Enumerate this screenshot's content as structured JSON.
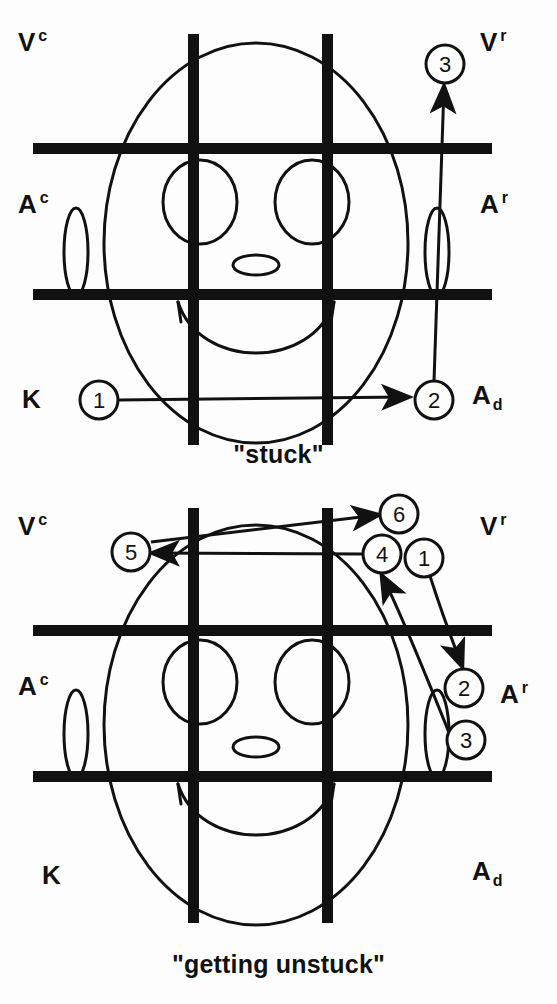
{
  "figure": {
    "type": "diagram",
    "background_color": "#fdfdfd",
    "ink_color": "#111111"
  },
  "panels": [
    {
      "id": "stuck",
      "caption": "\"stuck\"",
      "quadrant_labels": [
        {
          "id": "vc",
          "base": "V",
          "sup": "c",
          "x": 18,
          "y": 28
        },
        {
          "id": "vr",
          "base": "V",
          "sup": "r",
          "x": 478,
          "y": 28
        },
        {
          "id": "ac",
          "base": "A",
          "sup": "c",
          "x": 18,
          "y": 190
        },
        {
          "id": "ar",
          "base": "A",
          "sup": "r",
          "x": 478,
          "y": 190
        },
        {
          "id": "k",
          "base": "K",
          "sup": "",
          "x": 22,
          "y": 382
        },
        {
          "id": "ad",
          "base": "A",
          "sub": "d",
          "x": 470,
          "y": 382
        }
      ],
      "markers": [
        {
          "label": "1",
          "cx": 99,
          "cy": 400,
          "r": 19
        },
        {
          "label": "2",
          "cx": 434,
          "cy": 400,
          "r": 19
        },
        {
          "label": "3",
          "cx": 445,
          "cy": 64,
          "r": 19
        }
      ],
      "arrows": [
        {
          "from": "1",
          "to": "2",
          "kind": "horizontal-right"
        },
        {
          "from": "2",
          "to": "3",
          "kind": "vertical-up"
        }
      ]
    },
    {
      "id": "unstuck",
      "caption": "\"getting unstuck\"",
      "quadrant_labels": [
        {
          "id": "vc",
          "base": "V",
          "sup": "c",
          "x": 18,
          "y": 512
        },
        {
          "id": "vr",
          "base": "V",
          "sup": "r",
          "x": 478,
          "y": 512
        },
        {
          "id": "ac",
          "base": "A",
          "sup": "c",
          "x": 18,
          "y": 672
        },
        {
          "id": "ar",
          "base": "A",
          "sup": "r",
          "x": 478,
          "y": 680
        },
        {
          "id": "k",
          "base": "K",
          "sup": "",
          "x": 42,
          "y": 862
        },
        {
          "id": "ad",
          "base": "A",
          "sub": "d",
          "x": 470,
          "y": 862
        }
      ],
      "markers": [
        {
          "label": "1",
          "cx": 424,
          "cy": 558,
          "r": 19
        },
        {
          "label": "2",
          "cx": 464,
          "cy": 688,
          "r": 19
        },
        {
          "label": "3",
          "cx": 466,
          "cy": 740,
          "r": 19
        },
        {
          "label": "4",
          "cx": 382,
          "cy": 554,
          "r": 19
        },
        {
          "label": "5",
          "cx": 131,
          "cy": 552,
          "r": 19
        },
        {
          "label": "6",
          "cx": 399,
          "cy": 514,
          "r": 19
        }
      ],
      "arrows": [
        {
          "from": "1",
          "to": "2",
          "kind": "curve-down-right"
        },
        {
          "from": "3",
          "to": "4",
          "kind": "curve-up-left"
        },
        {
          "from": "4",
          "to": "5",
          "kind": "horizontal-left"
        },
        {
          "from": "5",
          "to": "6",
          "kind": "diagonal-up-right"
        }
      ]
    }
  ],
  "grid": {
    "bar_color": "#111111",
    "bar_thickness": 11,
    "vertical_bar_x": [
      188,
      322
    ],
    "horizontal_bar_y": [
      148,
      294
    ]
  }
}
